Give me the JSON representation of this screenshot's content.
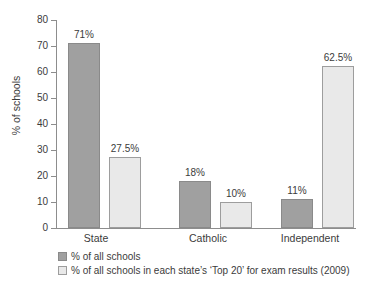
{
  "chart_data": {
    "type": "bar",
    "title": "",
    "xlabel": "",
    "ylabel": "% of schools",
    "ylim": [
      0,
      80
    ],
    "ytick_labels": [
      "80",
      "70",
      "60",
      "50",
      "40",
      "30",
      "20",
      "10",
      "0"
    ],
    "yticks": [
      80,
      70,
      60,
      50,
      40,
      30,
      20,
      10,
      0
    ],
    "grid": false,
    "legend_position": "below-left",
    "categories": [
      "State",
      "Catholic",
      "Independent"
    ],
    "series": [
      {
        "name": "% of all schools",
        "values": [
          71,
          18,
          11
        ],
        "labels": [
          "71%",
          "18%",
          "11%"
        ],
        "color": "#a0a0a0"
      },
      {
        "name": "% of all schools in each state's ‘Top 20’ for exam results (2009)",
        "values": [
          27.5,
          10,
          62.5
        ],
        "labels": [
          "27.5%",
          "10%",
          "62.5%"
        ],
        "color": "#e9e9e9"
      }
    ]
  },
  "axis": {
    "y_title": "% of schools"
  },
  "legend": {
    "items": [
      {
        "label": "% of all schools"
      },
      {
        "label": "% of all schools in each state’s ‘Top 20’ for exam results (2009)"
      }
    ]
  },
  "colors": {
    "series_0": "#a0a0a0",
    "series_1": "#e9e9e9",
    "axis": "#8d8d8d",
    "text": "#3b3b3b",
    "background": "#ffffff"
  }
}
